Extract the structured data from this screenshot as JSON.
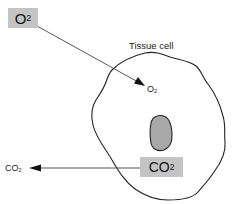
{
  "diagram": {
    "labels": {
      "o2_source": {
        "main": "O",
        "sub": "2"
      },
      "o2_destination": {
        "main": "O",
        "sub": "2"
      },
      "cell": "Tissue cell",
      "co2_source": {
        "main": "CO",
        "sub": "2"
      },
      "co2_destination": {
        "main": "CO",
        "sub": "2"
      }
    },
    "arrows": [
      {
        "name": "o2-diffusion-arrow",
        "from": "O2 box (outside)",
        "to": "inside tissue cell"
      },
      {
        "name": "co2-diffusion-arrow",
        "from": "CO2 box (inside cell)",
        "to": "outside tissue cell"
      }
    ],
    "colors": {
      "box_fill": "#c4c4c4",
      "nucleus_fill": "#a8a8a8",
      "line": "#222222",
      "background": "#ffffff"
    }
  }
}
